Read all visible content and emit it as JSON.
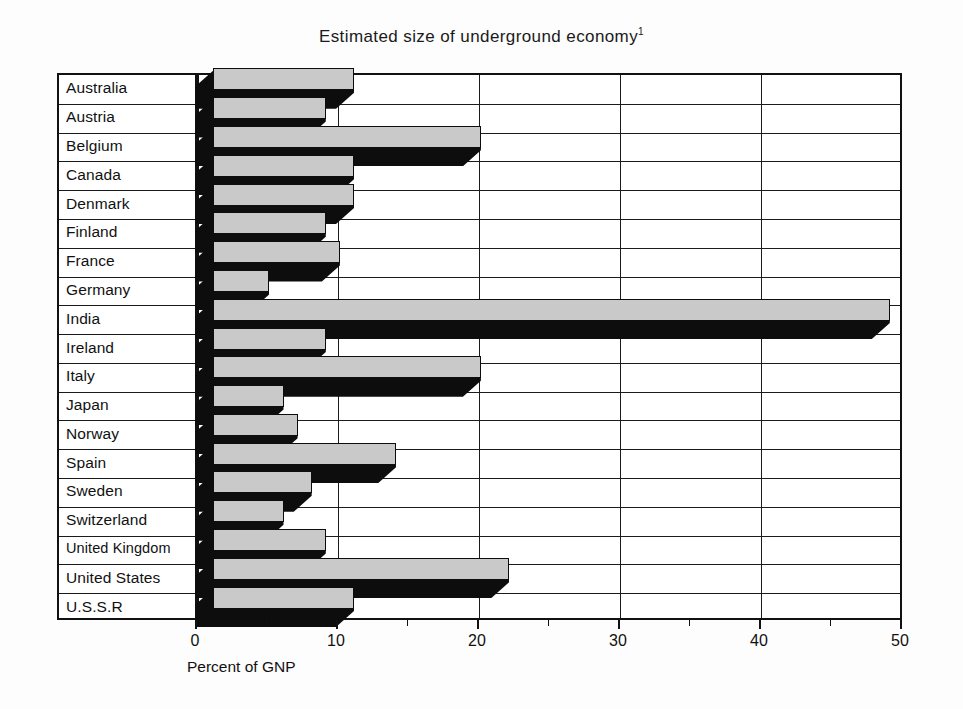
{
  "chart": {
    "title": "Estimated size of underground economy",
    "title_superscript": "1",
    "x_axis_title": "Percent of GNP"
  },
  "chart_data": {
    "type": "bar",
    "orientation": "horizontal",
    "xlabel": "Percent of GNP",
    "ylabel": "",
    "xlim": [
      0,
      50
    ],
    "grid": true,
    "legend": null,
    "x_ticks_major": [
      0,
      10,
      20,
      30,
      40,
      50
    ],
    "x_ticks_minor": [
      5,
      15,
      25,
      35,
      45
    ],
    "x_tick_labels": [
      "0",
      "10",
      "20",
      "30",
      "40",
      "50"
    ],
    "categories": [
      "Australia",
      "Austria",
      "Belgium",
      "Canada",
      "Denmark",
      "Finland",
      "France",
      "Germany",
      "India",
      "Ireland",
      "Italy",
      "Japan",
      "Norway",
      "Spain",
      "Sweden",
      "Switzerland",
      "United Kingdom",
      "United States",
      "U.S.S.R"
    ],
    "values": [
      10,
      8,
      19,
      10,
      10,
      8,
      9,
      4,
      48,
      8,
      19,
      5,
      6,
      13,
      7,
      5,
      8,
      21,
      10
    ],
    "value_unit": "percent of GNP"
  },
  "colors": {
    "bar_face": "#c9c9c9",
    "bar_shadow": "#0d0d0d",
    "frame": "#111111",
    "background": "#ffffff"
  }
}
